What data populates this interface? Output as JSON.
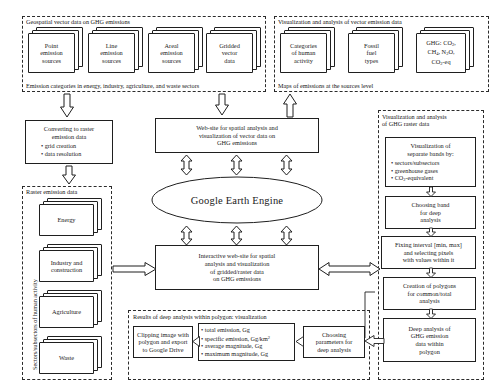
{
  "diagram": {
    "colors": {
      "stroke": "#1f1f1f",
      "dashed": "#2b2b2b",
      "background": "#ffffff"
    }
  },
  "panels": {
    "vector_data": {
      "title": "Geospatial vector data on GHG emissions",
      "footer": "Emission categories in energy, industry, agriculture, and waste sectors",
      "stacks": [
        {
          "lines": [
            "Point",
            "emission",
            "sources"
          ]
        },
        {
          "lines": [
            "Line",
            "emission",
            "sources"
          ]
        },
        {
          "lines": [
            "Areal",
            "emission",
            "sources"
          ]
        },
        {
          "lines": [
            "Gridded",
            "vector",
            "data"
          ]
        }
      ]
    },
    "vector_visualization": {
      "title": "Visualization and analysis of vector emission data",
      "footer": "Maps of emissions at the sources level",
      "stacks": [
        {
          "lines": [
            "Categories",
            "of human",
            "activity"
          ]
        },
        {
          "lines": [
            "Fossil",
            "fuel",
            "types"
          ]
        },
        {
          "lines": [
            "GHG: CO2,",
            "CH4, N2O,",
            "CO2-eq"
          ]
        }
      ]
    },
    "raster_data": {
      "title": "Raster emission data",
      "side_label": "Sectors/subsectors of human activity",
      "stacks": [
        {
          "lines": [
            "Energy"
          ]
        },
        {
          "lines": [
            "Industry and",
            "construction"
          ]
        },
        {
          "lines": [
            "Agriculture"
          ]
        },
        {
          "lines": [
            "Waste"
          ]
        }
      ]
    },
    "raster_visualization": {
      "title_line1": "Visualization and analysis",
      "title_line2": "of GHG raster data"
    },
    "deep_results": {
      "title": "Results of deep analysis within polygon: visualization"
    }
  },
  "boxes": {
    "converting": {
      "lines": [
        "Converting to raster",
        "emission data"
      ],
      "bullets": [
        "• grid creation",
        "• data resolution"
      ]
    },
    "vector_website": {
      "lines": [
        "Web-site for spatial analysis and",
        "visualization  of  vector data on",
        "GHG emissions"
      ]
    },
    "gee": {
      "label": "Google Earth Engine"
    },
    "raster_website": {
      "lines": [
        "Interactive web-site for spatial",
        "analysis and visualization",
        "of  gridded/raster  data",
        "on GHG emissions"
      ]
    },
    "visualization_bands": {
      "lines": [
        "Visualization of",
        "separate bands by:"
      ],
      "bullets": [
        "• sectors/subsectors",
        "• greenhouse gases",
        "• CO2-equivalent"
      ]
    },
    "choosing_band": {
      "lines": [
        "Choosing band",
        "for deep",
        "analysis"
      ]
    },
    "fixing_interval": {
      "lines": [
        "Fixing interval [min, max]",
        "and selecting pixels",
        "with values within it"
      ]
    },
    "creation_polygons": {
      "lines": [
        "Creation of polygons",
        "for common/total",
        "analysis"
      ]
    },
    "deep_analysis": {
      "lines": [
        "Deep analysis of",
        "GHG emission",
        "data within",
        "polygon"
      ]
    },
    "clipping": {
      "lines": [
        "Clipping image with",
        "polygon and export",
        "to Google Drive"
      ]
    },
    "metrics": {
      "bullets": [
        "• total emission, Gg",
        "• specific emission, Gg/km2",
        "• average magnitude, Gg",
        "• maximum magnitude, Gg"
      ]
    },
    "choosing_params": {
      "lines": [
        "Choosing",
        "parameters for",
        "deep analysis"
      ]
    }
  }
}
